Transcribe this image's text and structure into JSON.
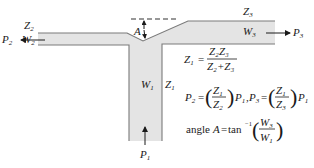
{
  "diagram": {
    "fill_color": "#e4e4e4",
    "edge_color": "#7a7a7a",
    "ports": {
      "p1": {
        "label": "P",
        "sub": "1",
        "direction": "up"
      },
      "p2": {
        "label": "P",
        "sub": "2",
        "direction": "left"
      },
      "p3": {
        "label": "P",
        "sub": "3",
        "direction": "right"
      }
    },
    "lines": {
      "z1": {
        "label": "Z",
        "sub": "1"
      },
      "z2": {
        "label": "Z",
        "sub": "2"
      },
      "z3": {
        "label": "Z",
        "sub": "3"
      },
      "w1": {
        "label": "W",
        "sub": "1"
      },
      "w2": {
        "label": "W",
        "sub": "2"
      },
      "w3": {
        "label": "W",
        "sub": "3"
      }
    },
    "angle_label": "A",
    "equations": {
      "eq1": {
        "lhs": "Z",
        "lhs_sub": "1",
        "num": "Z₂Z₃",
        "den": "Z₂+Z₃"
      },
      "eq2": {
        "p2": "P",
        "p2_sub": "2",
        "frac_num": "Z",
        "frac_num_sub": "1",
        "frac_den": "Z",
        "frac_den_sub": "2",
        "p1": "P",
        "p1_sub": "1"
      },
      "eq3": {
        "p3": "P",
        "p3_sub": "3",
        "frac_num": "Z",
        "frac_num_sub": "1",
        "frac_den": "Z",
        "frac_den_sub": "3",
        "p1": "P",
        "p1_sub": "1"
      },
      "eq4": {
        "prefix": "angle",
        "var": "A",
        "func": "tan",
        "exp": "−1",
        "frac_num": "W",
        "frac_num_sub": "3",
        "frac_den": "W",
        "frac_den_sub": "1"
      }
    }
  }
}
